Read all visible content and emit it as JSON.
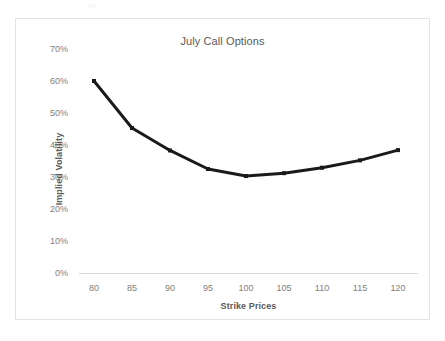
{
  "page": {
    "background": "#ffffff",
    "artifact_glyph": "▭"
  },
  "frame": {
    "border_color": "#e3e3e3"
  },
  "chart_data": {
    "type": "line",
    "title": "July Call Options",
    "xlabel": "Strike Prices",
    "ylabel": "Implied Volatility",
    "categories": [
      80,
      85,
      90,
      95,
      100,
      105,
      110,
      115,
      120
    ],
    "x_tick_labels": [
      "80",
      "85",
      "90",
      "95",
      "100",
      "105",
      "110",
      "115",
      "120"
    ],
    "values": [
      60.0,
      45.3,
      38.3,
      32.5,
      30.3,
      31.2,
      32.9,
      35.2,
      38.4
    ],
    "y_tick_labels": [
      "70%",
      "60%",
      "50%",
      "40%",
      "30%",
      "20%",
      "10%",
      "0%"
    ],
    "y_ticks": [
      70,
      60,
      50,
      40,
      30,
      20,
      10,
      0
    ],
    "ylim": [
      0,
      70
    ],
    "xlim": [
      80,
      120
    ],
    "grid": false,
    "legend": null,
    "legend_position": "none",
    "series_color": "#1a1a1a",
    "marker": "square",
    "marker_size": 4,
    "line_width": 3,
    "axis_text_color": "#808080",
    "axis_title_color": "#5a5a5a",
    "title_color": "#595959",
    "axis_line_color": "#d9d9d9"
  }
}
